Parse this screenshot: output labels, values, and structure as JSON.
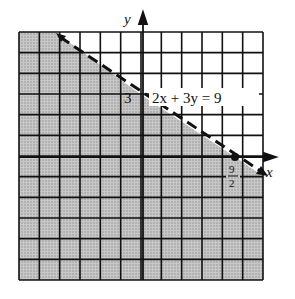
{
  "chart_data": {
    "type": "inequality-graph",
    "title": "",
    "equation_label": "2x + 3y = 9",
    "boundary_style": "dashed",
    "shaded_region": "below line (2x + 3y < 9)",
    "xlabel": "x",
    "ylabel": "y",
    "y_intercept_label": "3",
    "x_intercept_label_num": "9",
    "x_intercept_label_den": "2",
    "x_intercept": 4.5,
    "y_intercept": 3,
    "xlim": [
      -6,
      6
    ],
    "ylim": [
      -6,
      6
    ],
    "grid": true,
    "points": [
      {
        "x": 4.5,
        "y": 0,
        "filled": true
      }
    ]
  },
  "colors": {
    "shade": "#bdbdbd",
    "grid": "#111111",
    "background": "#ffffff"
  }
}
